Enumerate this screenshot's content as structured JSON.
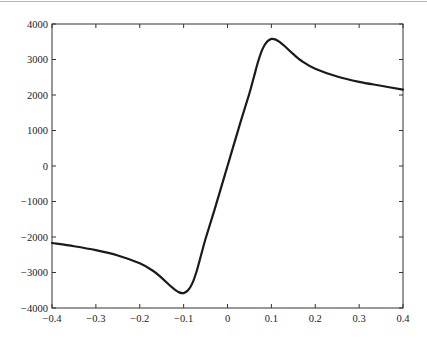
{
  "chart_data": {
    "type": "line",
    "title": "",
    "xlabel": "",
    "ylabel": "",
    "xlim": [
      -0.4,
      0.4
    ],
    "ylim": [
      -4000,
      4000
    ],
    "grid": false,
    "legend": null,
    "x_ticks": [
      "-0.4",
      "-0.3",
      "-0.2",
      "-0.1",
      "0",
      "0.1",
      "0.2",
      "0.3",
      "0.4"
    ],
    "y_ticks": [
      "4000",
      "3000",
      "2000",
      "1000",
      "0",
      "-1000",
      "-2000",
      "-3000",
      "-4000"
    ],
    "series": [
      {
        "name": "curve",
        "color": "#1a1a1a",
        "x": [
          -0.4,
          -0.35,
          -0.3,
          -0.25,
          -0.2,
          -0.17,
          -0.15,
          -0.13,
          -0.12,
          -0.11,
          -0.1,
          -0.09,
          -0.08,
          -0.07,
          -0.06,
          -0.05,
          -0.03,
          0,
          0.03,
          0.05,
          0.06,
          0.07,
          0.08,
          0.09,
          0.1,
          0.11,
          0.12,
          0.13,
          0.15,
          0.17,
          0.2,
          0.25,
          0.3,
          0.35,
          0.4
        ],
        "y": [
          -2170,
          -2260,
          -2370,
          -2520,
          -2740,
          -2950,
          -3150,
          -3380,
          -3480,
          -3560,
          -3580,
          -3500,
          -3300,
          -2950,
          -2500,
          -2050,
          -1250,
          0,
          1250,
          2050,
          2500,
          2950,
          3300,
          3500,
          3580,
          3560,
          3480,
          3380,
          3150,
          2950,
          2740,
          2520,
          2370,
          2260,
          2150
        ]
      }
    ]
  }
}
